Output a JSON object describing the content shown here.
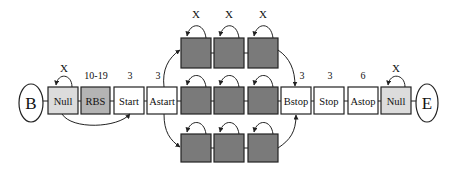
{
  "diagram": {
    "type": "state-transition",
    "start_node": {
      "label": "B"
    },
    "end_node": {
      "label": "E"
    },
    "colors": {
      "null_fill": "#dcdcdc",
      "rbs_fill": "#b4b4b4",
      "white_fill": "#ffffff",
      "gene_fill": "#7a7a7a",
      "stroke": "#222222"
    },
    "states": [
      {
        "id": "null1",
        "label": "Null",
        "annotation": "X"
      },
      {
        "id": "rbs",
        "label": "RBS",
        "annotation": "10-19"
      },
      {
        "id": "start",
        "label": "Start",
        "annotation": "3"
      },
      {
        "id": "astart",
        "label": "Astart",
        "annotation": "3"
      },
      {
        "id": "bstop",
        "label": "Bstop",
        "annotation": "3"
      },
      {
        "id": "stop",
        "label": "Stop",
        "annotation": "3"
      },
      {
        "id": "astop",
        "label": "Astop",
        "annotation": "6"
      },
      {
        "id": "null2",
        "label": "Null",
        "annotation": "X"
      }
    ],
    "gene_rows": [
      {
        "name": "top",
        "annotations": [
          "X",
          "X",
          "X"
        ]
      },
      {
        "name": "middle",
        "annotations": [
          "",
          "",
          ""
        ]
      },
      {
        "name": "bottom",
        "annotations": [
          "",
          "",
          ""
        ]
      }
    ]
  }
}
